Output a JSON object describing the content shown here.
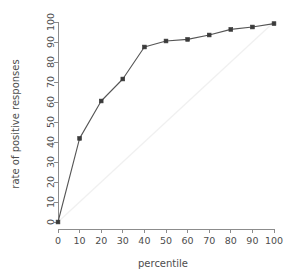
{
  "chart_data": {
    "type": "line",
    "title": "",
    "subtitle": "",
    "xlabel": "percentile",
    "ylabel": "rate of positive responses",
    "x": [
      0,
      10,
      20,
      30,
      40,
      50,
      60,
      70,
      80,
      90,
      100
    ],
    "values": [
      0,
      41.8,
      60.5,
      71.5,
      87.5,
      90.5,
      91.3,
      93.5,
      96.3,
      97.5,
      99.2
    ],
    "series": [
      {
        "name": "rate of positive responses",
        "x": [
          0,
          10,
          20,
          30,
          40,
          50,
          60,
          70,
          80,
          90,
          100
        ],
        "values": [
          0,
          41.8,
          60.5,
          71.5,
          87.5,
          90.5,
          91.3,
          93.5,
          96.3,
          97.5,
          99.2
        ],
        "color": "#555555",
        "marker": "square",
        "marker_color": "#3a3a3a"
      },
      {
        "name": "reference diagonal",
        "x": [
          0,
          100
        ],
        "values": [
          0,
          100
        ],
        "color": "#f0f0f0",
        "marker": "none"
      }
    ],
    "xlim": [
      0,
      100
    ],
    "ylim": [
      0,
      100
    ],
    "xticks": [
      0,
      10,
      20,
      30,
      40,
      50,
      60,
      70,
      80,
      90,
      100
    ],
    "yticks": [
      0,
      10,
      20,
      30,
      40,
      50,
      60,
      70,
      80,
      90,
      100
    ],
    "xtick_labels": [
      "0",
      "10",
      "20",
      "30",
      "40",
      "50",
      "60",
      "70",
      "80",
      "90",
      "100"
    ],
    "ytick_labels": [
      "0",
      "10",
      "20",
      "30",
      "40",
      "50",
      "60",
      "70",
      "80",
      "90",
      "100"
    ],
    "grid": false,
    "legend": false,
    "legend_position": "none",
    "ytick_label_rotation": 90,
    "annotations": []
  },
  "axes": {
    "x_title": "percentile",
    "y_title": "rate of positive responses"
  },
  "ticks": {
    "x": [
      "0",
      "10",
      "20",
      "30",
      "40",
      "50",
      "60",
      "70",
      "80",
      "90",
      "100"
    ],
    "y": [
      "0",
      "10",
      "20",
      "30",
      "40",
      "50",
      "60",
      "70",
      "80",
      "90",
      "100"
    ]
  },
  "colors": {
    "background": "#ffffff",
    "axis": "#8c8c8c",
    "data_line": "#555555",
    "marker": "#3a3a3a",
    "reference_line": "#f0f0f0",
    "text": "#4d4d4d"
  }
}
